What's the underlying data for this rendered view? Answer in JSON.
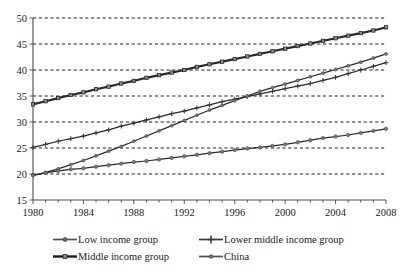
{
  "chart_data": {
    "type": "line",
    "title": "",
    "subtitle": "",
    "xlabel": "",
    "ylabel": "",
    "xlim": [
      1980,
      2008
    ],
    "ylim": [
      15,
      50
    ],
    "yticks": [
      15,
      20,
      25,
      30,
      35,
      40,
      45,
      50
    ],
    "ytick_labels": [
      "15",
      "20",
      "25",
      "30",
      "35",
      "40",
      "45",
      "50"
    ],
    "xticks": [
      1980,
      1984,
      1988,
      1992,
      1996,
      2000,
      2004,
      2008
    ],
    "xtick_labels": [
      "1980",
      "1984",
      "1988",
      "1992",
      "1996",
      "2000",
      "2004",
      "2008"
    ],
    "x_minor_tick_step": 1,
    "grid": "horizontal-dashed",
    "legend_position": "bottom",
    "x": [
      1980,
      1981,
      1982,
      1983,
      1984,
      1985,
      1986,
      1987,
      1988,
      1989,
      1990,
      1991,
      1992,
      1993,
      1994,
      1995,
      1996,
      1997,
      1998,
      1999,
      2000,
      2001,
      2002,
      2003,
      2004,
      2005,
      2006,
      2007,
      2008
    ],
    "series": [
      {
        "name": "Low income group",
        "marker": "circle",
        "color": "#4f4f4f",
        "values": [
          19.8,
          20.2,
          20.6,
          20.9,
          21.1,
          21.4,
          21.7,
          22.0,
          22.3,
          22.5,
          22.8,
          23.1,
          23.4,
          23.7,
          24.0,
          24.3,
          24.6,
          24.9,
          25.1,
          25.4,
          25.7,
          26.1,
          26.5,
          26.9,
          27.2,
          27.5,
          27.9,
          28.3,
          28.7
        ]
      },
      {
        "name": "Lower middle income group",
        "marker": "plus",
        "color": "#3a3a3a",
        "values": [
          25.1,
          25.7,
          26.3,
          26.8,
          27.3,
          27.9,
          28.5,
          29.2,
          29.8,
          30.4,
          31.0,
          31.6,
          32.1,
          32.7,
          33.3,
          33.9,
          34.4,
          34.9,
          35.4,
          35.9,
          36.4,
          36.9,
          37.4,
          38.0,
          38.6,
          39.3,
          40.0,
          40.7,
          41.4
        ]
      },
      {
        "name": "Middle income group",
        "marker": "square",
        "color": "#1c1c1c",
        "values": [
          33.4,
          34.0,
          34.6,
          35.2,
          35.7,
          36.3,
          36.8,
          37.4,
          37.9,
          38.5,
          39.0,
          39.5,
          40.0,
          40.6,
          41.1,
          41.6,
          42.1,
          42.6,
          43.1,
          43.6,
          44.1,
          44.6,
          45.1,
          45.6,
          46.1,
          46.6,
          47.1,
          47.6,
          48.2
        ]
      },
      {
        "name": "China",
        "marker": "circle-small",
        "color": "#4f4f4f",
        "values": [
          19.7,
          20.3,
          21.0,
          21.8,
          22.6,
          23.5,
          24.4,
          25.3,
          26.3,
          27.3,
          28.3,
          29.3,
          30.3,
          31.3,
          32.3,
          33.2,
          34.1,
          35.0,
          35.9,
          36.6,
          37.3,
          38.0,
          38.7,
          39.4,
          40.1,
          40.8,
          41.5,
          42.3,
          43.1
        ]
      }
    ]
  },
  "legend": {
    "items": [
      {
        "label": "Low income group"
      },
      {
        "label": "Lower middle income group"
      },
      {
        "label": "Middle income group"
      },
      {
        "label": "China"
      }
    ]
  }
}
